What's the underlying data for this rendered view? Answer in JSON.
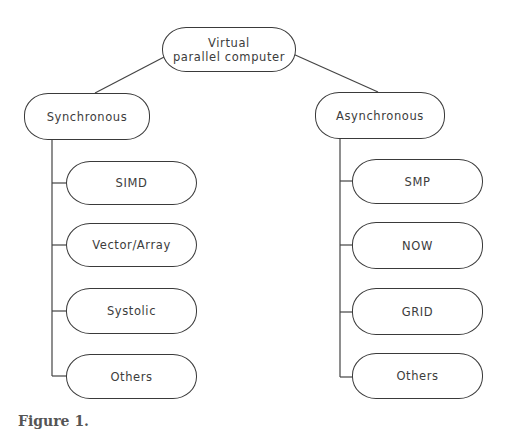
{
  "diagram": {
    "root": {
      "label_line1": "Virtual",
      "label_line2": "parallel computer"
    },
    "branches": [
      {
        "label": "Synchronous",
        "children": [
          "SIMD",
          "Vector/Array",
          "Systolic",
          "Others"
        ]
      },
      {
        "label": "Asynchronous",
        "children": [
          "SMP",
          "NOW",
          "GRID",
          "Others"
        ]
      }
    ],
    "caption": "Figure 1."
  }
}
